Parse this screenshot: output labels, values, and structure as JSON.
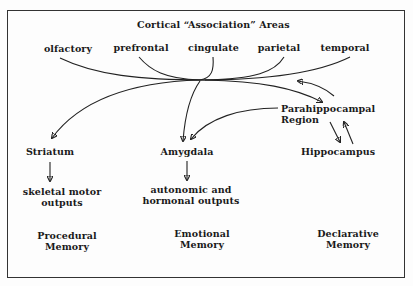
{
  "diagram": {
    "title": "Cortical “Association” Areas",
    "cortical_areas": [
      "olfactory",
      "prefrontal",
      "cingulate",
      "parietal",
      "temporal"
    ],
    "nodes": {
      "parahippocampal": [
        "Parahippocampal",
        "Region"
      ],
      "striatum": "Striatum",
      "amygdala": "Amygdala",
      "hippocampus": "Hippocampus",
      "skeletal": [
        "skeletal motor",
        "outputs"
      ],
      "autonomic": [
        "autonomic and",
        "hormonal outputs"
      ]
    },
    "memory_types": [
      [
        "Procedural",
        "Memory"
      ],
      [
        "Emotional",
        "Memory"
      ],
      [
        "Declarative",
        "Memory"
      ]
    ],
    "edges": [
      {
        "from": "cortical_areas",
        "to": "Striatum"
      },
      {
        "from": "cortical_areas",
        "to": "Amygdala"
      },
      {
        "from": "cortical_areas",
        "to": "Parahippocampal Region"
      },
      {
        "from": "Parahippocampal Region",
        "to": "cortical_areas"
      },
      {
        "from": "Parahippocampal Region",
        "to": "Amygdala"
      },
      {
        "from": "Parahippocampal Region",
        "to": "Hippocampus"
      },
      {
        "from": "Hippocampus",
        "to": "Parahippocampal Region"
      },
      {
        "from": "Striatum",
        "to": "skeletal motor outputs"
      },
      {
        "from": "Amygdala",
        "to": "autonomic and hormonal outputs"
      }
    ]
  }
}
